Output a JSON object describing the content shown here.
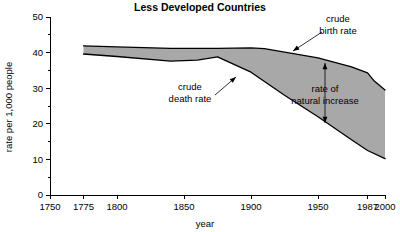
{
  "chart_data": {
    "type": "area",
    "title": "Less Developed Countries",
    "xlabel": "year",
    "ylabel": "rate per 1,000 people",
    "xlim": [
      1750,
      2000
    ],
    "ylim": [
      0,
      50
    ],
    "grid": false,
    "legend_position": "none",
    "x_ticks": [
      1750,
      1775,
      1800,
      1850,
      1900,
      1950,
      1987,
      2000
    ],
    "x_tick_labels": [
      "1750",
      "1775",
      "1800",
      "1850",
      "1900",
      "1950",
      "1987",
      "2000"
    ],
    "y_ticks": [
      0,
      10,
      20,
      30,
      40,
      50
    ],
    "y_tick_labels": [
      "0",
      "10",
      "20",
      "30",
      "40",
      "50"
    ],
    "y_minor_ticks": [
      5,
      15,
      25,
      35,
      45
    ],
    "series": [
      {
        "name": "crude birth rate",
        "x": [
          1775,
          1800,
          1840,
          1875,
          1900,
          1910,
          1950,
          1975,
          1987,
          1992,
          2000
        ],
        "values": [
          41.9,
          41.6,
          41.2,
          41.2,
          41.3,
          41.1,
          38.5,
          36.0,
          34.3,
          32.0,
          29.5
        ]
      },
      {
        "name": "crude death rate",
        "x": [
          1775,
          1800,
          1840,
          1860,
          1875,
          1900,
          1925,
          1950,
          1975,
          1987,
          2000
        ],
        "values": [
          39.6,
          38.9,
          37.6,
          37.9,
          38.8,
          34.5,
          28.0,
          22.0,
          15.5,
          12.5,
          10.2
        ]
      }
    ],
    "shaded_region": {
      "name": "rate of natural increase",
      "upper_series": "crude birth rate",
      "lower_series": "crude death rate",
      "color": "#a8a8a8"
    },
    "annotations": [
      {
        "name": "crude-birth-rate",
        "lines": [
          "crude",
          "birth rate"
        ],
        "text_x": 338,
        "text_y": 22,
        "anchor": "middle",
        "leader_from_x": 322,
        "leader_from_y": 32,
        "leader_to_x": 293,
        "leader_to_y": 51,
        "arrow": "end"
      },
      {
        "name": "crude-death-rate",
        "lines": [
          "crude",
          "death rate"
        ],
        "text_x": 190,
        "text_y": 90,
        "anchor": "middle",
        "leader_from_x": 215,
        "leader_from_y": 95,
        "leader_to_x": 236,
        "leader_to_y": 77,
        "arrow": "end"
      },
      {
        "name": "rate-of-natural-increase",
        "lines": [
          "rate of",
          "natural increase"
        ],
        "text_x": 325,
        "text_y": 92,
        "anchor": "middle",
        "double_arrow_x": 325,
        "double_arrow_top_y": 63,
        "double_arrow_bottom_y": 123
      }
    ]
  }
}
